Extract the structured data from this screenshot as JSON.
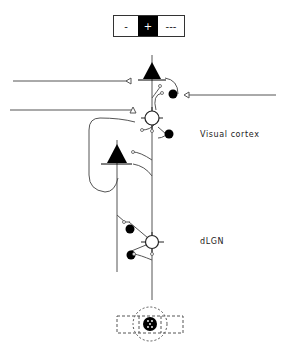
{
  "stimulus_bar": {
    "segments": [
      {
        "label": "-",
        "fill": "#ffffff",
        "text_color": "#222222",
        "width": 24
      },
      {
        "label": "+",
        "fill": "#000000",
        "text_color": "#ffffff",
        "width": 20
      },
      {
        "label": "---",
        "fill": "#ffffff",
        "text_color": "#222222",
        "width": 26
      }
    ]
  },
  "labels": {
    "visual_cortex": "Visual cortex",
    "dlgn": "dLGN"
  },
  "colors": {
    "line": "#555555",
    "inhibitory_fill": "#000000",
    "pyramidal_fill": "#000000",
    "relay_fill": "#ffffff"
  },
  "cells": {
    "cortex_pyramidal_top": "pyramidal-cell",
    "cortex_relay_circle": "stellate-cell",
    "cortex_inhibitory_1": "inhibitory-interneuron",
    "cortex_inhibitory_2": "inhibitory-interneuron",
    "layer6_pyramidal": "corticothalamic-pyramidal-cell",
    "dlgn_relay": "relay-cell",
    "dlgn_inhibitory_1": "inhibitory-interneuron",
    "dlgn_inhibitory_2": "inhibitory-interneuron"
  },
  "receptive_field": {
    "center": "on-center",
    "surround": "dashed-surround"
  }
}
